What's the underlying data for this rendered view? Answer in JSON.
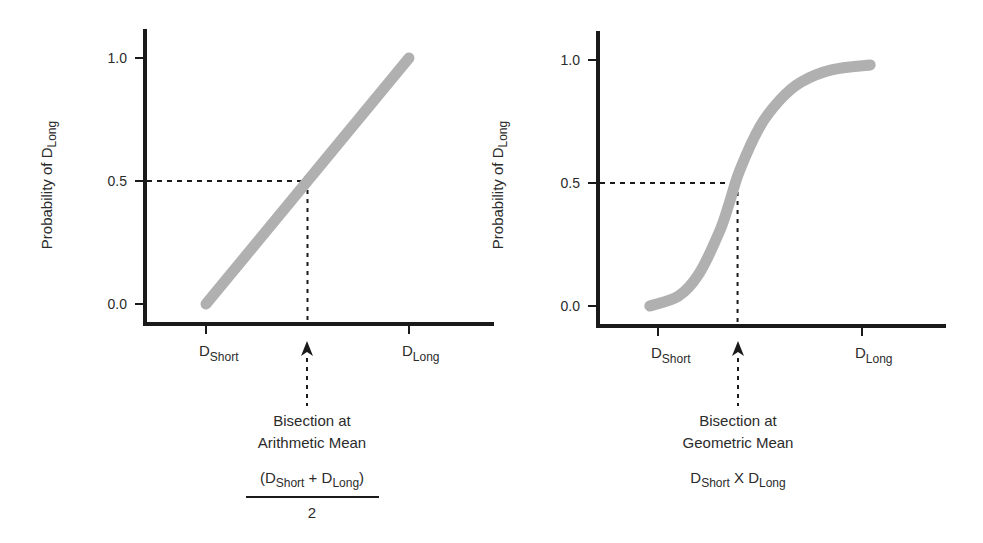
{
  "chart_data": [
    {
      "type": "line",
      "panel": "left",
      "title": "",
      "ylabel": {
        "main": "Probability of D",
        "sub": "Long"
      },
      "ylim": [
        0.0,
        1.0
      ],
      "yticks": [
        "0.0",
        "0.5",
        "1.0"
      ],
      "xcategories": [
        {
          "main": "D",
          "sub": "Short",
          "x": 0.0
        },
        {
          "main": "D",
          "sub": "Long",
          "x": 1.0
        }
      ],
      "curve": "linear",
      "series": [
        {
          "name": "Probability of D_Long",
          "x": [
            0.0,
            0.25,
            0.5,
            0.75,
            1.0
          ],
          "y": [
            0.0,
            0.25,
            0.5,
            0.75,
            1.0
          ]
        }
      ],
      "bisection": {
        "x": 0.5,
        "y": 0.5
      },
      "annotation": {
        "line1": "Bisection at",
        "line2": "Arithmetic Mean",
        "formula": {
          "open": "(D",
          "sub1": "Short",
          "mid": " + D",
          "sub2": "Long",
          "close": ")",
          "denominator": "2"
        }
      }
    },
    {
      "type": "line",
      "panel": "right",
      "title": "",
      "ylabel": {
        "main": "Probability of D",
        "sub": "Long"
      },
      "ylim": [
        0.0,
        1.0
      ],
      "yticks": [
        "0.0",
        "0.5",
        "1.0"
      ],
      "xcategories": [
        {
          "main": "D",
          "sub": "Short",
          "x": 0.0
        },
        {
          "main": "D",
          "sub": "Long",
          "x": 1.0
        }
      ],
      "curve": "sigmoid",
      "series": [
        {
          "name": "Probability of D_Long",
          "x": [
            -0.04,
            0.1,
            0.2,
            0.3,
            0.35,
            0.4,
            0.5,
            0.6,
            0.7,
            0.85,
            1.04
          ],
          "y": [
            0.0,
            0.04,
            0.13,
            0.3,
            0.42,
            0.55,
            0.73,
            0.84,
            0.91,
            0.96,
            0.98
          ]
        }
      ],
      "bisection": {
        "x": 0.39,
        "y": 0.5
      },
      "annotation": {
        "line1": "Bisection at",
        "line2": "Geometric Mean",
        "formula": {
          "a": "D",
          "sub1": "Short",
          "op": " X D",
          "sub2": "Long"
        }
      }
    }
  ],
  "colors": {
    "curve": "#b0b0b0",
    "axis": "#1a1a1a",
    "text": "#2b2b2b"
  }
}
